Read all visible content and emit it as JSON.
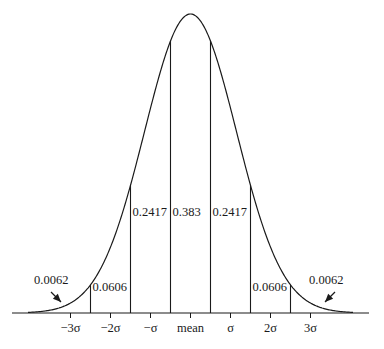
{
  "diagram": {
    "axis_ticks": [
      {
        "sigma": -3,
        "label": "−3σ"
      },
      {
        "sigma": -2,
        "label": "−2σ"
      },
      {
        "sigma": -1,
        "label": "−σ"
      },
      {
        "sigma": 0,
        "label": "mean"
      },
      {
        "sigma": 1,
        "label": "σ"
      },
      {
        "sigma": 2,
        "label": "2σ"
      },
      {
        "sigma": 3,
        "label": "3σ"
      }
    ],
    "boundaries_sigma": [
      -2.5,
      -1.5,
      -0.5,
      0.5,
      1.5,
      2.5
    ],
    "bands": [
      {
        "from": null,
        "to": -2.5,
        "label": "0.0062",
        "arrow": true
      },
      {
        "from": -2.5,
        "to": -1.5,
        "label": "0.0606"
      },
      {
        "from": -1.5,
        "to": -0.5,
        "label": "0.2417"
      },
      {
        "from": -0.5,
        "to": 0.5,
        "label": "0.383"
      },
      {
        "from": 0.5,
        "to": 1.5,
        "label": "0.2417"
      },
      {
        "from": 1.5,
        "to": 2.5,
        "label": "0.0606"
      },
      {
        "from": 2.5,
        "to": null,
        "label": "0.0062",
        "arrow": true
      }
    ],
    "line_color": "#1a1a1a"
  }
}
